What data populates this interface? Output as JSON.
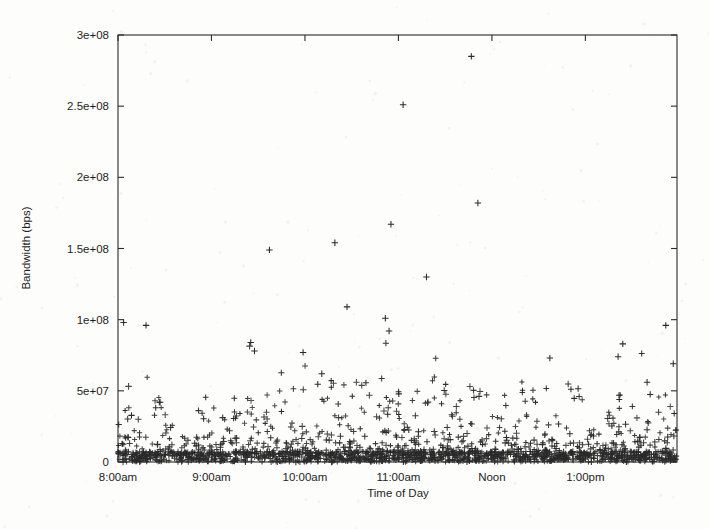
{
  "figure": {
    "background_color": "#fdfdfc",
    "ink_color": "#2a2a2a",
    "marker_symbol": "+",
    "marker_name": "plus-cross"
  },
  "chart_data": {
    "type": "scatter",
    "title": "",
    "xlabel": "Time of Day",
    "ylabel": "Bandwidth (bps)",
    "grid": false,
    "legend": null,
    "marker": "+",
    "xlim_hours": [
      8.0,
      13.98
    ],
    "ylim": [
      0,
      300000000
    ],
    "ytick_values": [
      0,
      50000000,
      100000000,
      150000000,
      200000000,
      250000000,
      300000000
    ],
    "ytick_labels": [
      "0",
      "5e+07",
      "1e+08",
      "1.5e+08",
      "2e+08",
      "2.5e+08",
      "3e+08"
    ],
    "xtick_hours": [
      8,
      9,
      10,
      11,
      12,
      13
    ],
    "xtick_labels": [
      "8:00am",
      "9:00am",
      "10:00am",
      "11:00am",
      "Noon",
      "1:00pm"
    ],
    "notable_points": [
      {
        "x_hour": 11.78,
        "y": 285000000,
        "label": "peak"
      },
      {
        "x_hour": 11.05,
        "y": 251000000
      },
      {
        "x_hour": 11.85,
        "y": 182000000
      },
      {
        "x_hour": 10.92,
        "y": 167000000
      },
      {
        "x_hour": 10.32,
        "y": 154000000
      },
      {
        "x_hour": 9.62,
        "y": 149000000
      },
      {
        "x_hour": 11.3,
        "y": 130000000
      },
      {
        "x_hour": 10.45,
        "y": 109000000
      },
      {
        "x_hour": 10.86,
        "y": 101000000
      },
      {
        "x_hour": 8.06,
        "y": 98000000
      },
      {
        "x_hour": 8.3,
        "y": 96000000
      },
      {
        "x_hour": 13.86,
        "y": 96000000
      },
      {
        "x_hour": 10.9,
        "y": 92000000
      },
      {
        "x_hour": 9.42,
        "y": 84000000
      },
      {
        "x_hour": 13.4,
        "y": 83000000
      },
      {
        "x_hour": 9.46,
        "y": 78000000
      },
      {
        "x_hour": 9.98,
        "y": 77000000
      },
      {
        "x_hour": 13.35,
        "y": 74000000
      },
      {
        "x_hour": 12.62,
        "y": 73000000
      },
      {
        "x_hour": 13.94,
        "y": 69000000
      },
      {
        "x_hour": 10.18,
        "y": 62000000
      },
      {
        "x_hour": 13.66,
        "y": 56000000
      }
    ],
    "description_series": [
      {
        "name": "bandwidth-samples",
        "note": "Dense low-amplitude cloud hugging the 0 baseline across the whole window, with a long upward tail of sparse outliers concentrated between 10:00am and noon.",
        "baseline_band": [
          0,
          12000000
        ],
        "typical_band": [
          0,
          50000000
        ],
        "approx_sample_count": 1800
      }
    ]
  },
  "axes": {
    "y_axis_title": "Bandwidth (bps)",
    "x_axis_title": "Time of Day"
  }
}
